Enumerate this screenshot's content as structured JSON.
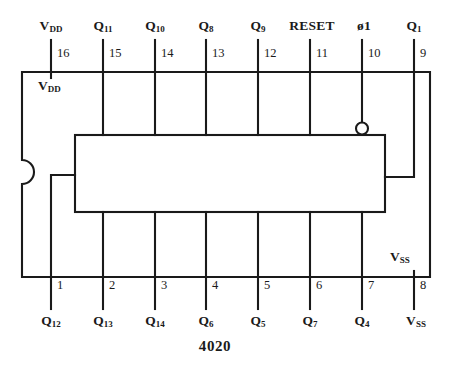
{
  "diagram": {
    "part_number": "4020",
    "package": {
      "notch_side": "left",
      "internal_rail_labels": [
        {
          "text_main": "V",
          "text_sub": "DD",
          "x": 38,
          "y": 79
        },
        {
          "text_main": "V",
          "text_sub": "SS",
          "x": 390,
          "y": 250
        }
      ]
    },
    "top_pins": [
      {
        "number": "16",
        "label_main": "V",
        "label_sub": "DD",
        "x": 51,
        "inverted": false
      },
      {
        "number": "15",
        "label_main": "Q",
        "label_sub": "11",
        "x": 103,
        "inverted": false
      },
      {
        "number": "14",
        "label_main": "Q",
        "label_sub": "10",
        "x": 155,
        "inverted": false
      },
      {
        "number": "13",
        "label_main": "Q",
        "label_sub": "8",
        "x": 206,
        "inverted": false
      },
      {
        "number": "12",
        "label_main": "Q",
        "label_sub": "9",
        "x": 258,
        "inverted": false
      },
      {
        "number": "11",
        "label_main": "RESET",
        "label_sub": "",
        "x": 310,
        "inverted": false
      },
      {
        "number": "10",
        "label_main": "ø1",
        "label_sub": "",
        "x": 362,
        "inverted": true
      },
      {
        "number": "9",
        "label_main": "Q",
        "label_sub": "1",
        "x": 414,
        "inverted": false
      }
    ],
    "bottom_pins": [
      {
        "number": "1",
        "label_main": "Q",
        "label_sub": "12",
        "x": 51
      },
      {
        "number": "2",
        "label_main": "Q",
        "label_sub": "13",
        "x": 103
      },
      {
        "number": "3",
        "label_main": "Q",
        "label_sub": "14",
        "x": 155
      },
      {
        "number": "4",
        "label_main": "Q",
        "label_sub": "6",
        "x": 206
      },
      {
        "number": "5",
        "label_main": "Q",
        "label_sub": "5",
        "x": 258
      },
      {
        "number": "6",
        "label_main": "Q",
        "label_sub": "7",
        "x": 310
      },
      {
        "number": "7",
        "label_main": "Q",
        "label_sub": "4",
        "x": 362
      },
      {
        "number": "8",
        "label_main": "V",
        "label_sub": "SS",
        "x": 414
      }
    ],
    "colors": {
      "line": "#1a1a1a",
      "background": "#ffffff",
      "text": "#1a1a1a"
    }
  }
}
